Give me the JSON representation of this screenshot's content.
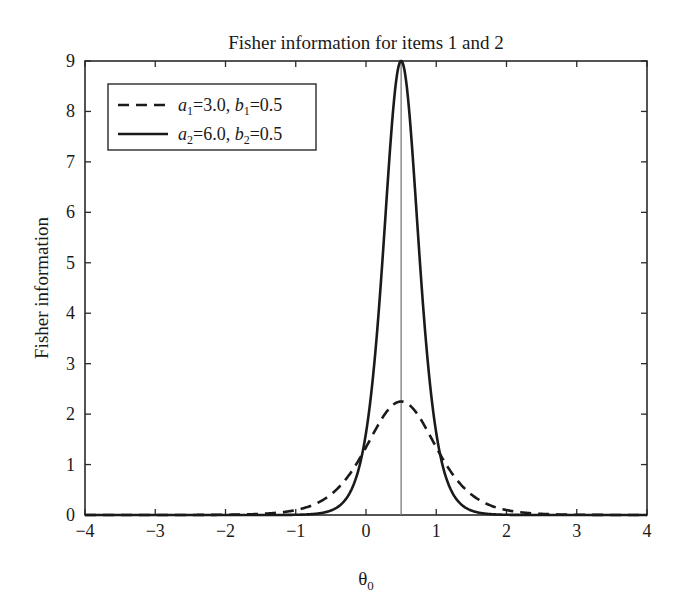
{
  "chart_data": {
    "type": "line",
    "title": "Fisher information for items 1 and 2",
    "xlabel": "θ",
    "xlabel_subscript": "0",
    "ylabel": "Fisher information",
    "xlim": [
      -4,
      4
    ],
    "ylim": [
      0,
      9
    ],
    "xticks": [
      -4,
      -3,
      -2,
      -1,
      0,
      1,
      2,
      3,
      4
    ],
    "xtick_labels": [
      "−4",
      "−3",
      "−2",
      "−1",
      "0",
      "1",
      "2",
      "3",
      "4"
    ],
    "yticks": [
      0,
      1,
      2,
      3,
      4,
      5,
      6,
      7,
      8,
      9
    ],
    "ytick_labels": [
      "0",
      "1",
      "2",
      "3",
      "4",
      "5",
      "6",
      "7",
      "8",
      "9"
    ],
    "grid": false,
    "tick_direction": "in",
    "legend_position": "upper left",
    "vertical_reference_line": {
      "x": 0.5,
      "color": "#7a7a7a"
    },
    "series": [
      {
        "name": "a1=3.0, b1=0.5",
        "legend": {
          "a_sym": "a",
          "a_sub": "1",
          "a_val": "=3.0, ",
          "b_sym": "b",
          "b_sub": "1",
          "b_val": "=0.5"
        },
        "style": "dashed",
        "a": 3.0,
        "b": 0.5,
        "x": [
          -4,
          -3,
          -2,
          -1.5,
          -1,
          -0.5,
          0,
          0.25,
          0.5,
          0.75,
          1,
          1.5,
          2,
          2.5,
          3,
          4
        ],
        "values": [
          0.0,
          0.0,
          0.0,
          0.02,
          0.1,
          0.4,
          1.22,
          1.84,
          2.25,
          1.84,
          1.22,
          0.4,
          0.1,
          0.02,
          0.0,
          0.0
        ]
      },
      {
        "name": "a2=6.0, b2=0.5",
        "legend": {
          "a_sym": "a",
          "a_sub": "2",
          "a_val": "=6.0, ",
          "b_sym": "b",
          "b_sub": "2",
          "b_val": "=0.5"
        },
        "style": "solid",
        "a": 6.0,
        "b": 0.5,
        "x": [
          -4,
          -2,
          -1,
          -0.5,
          -0.25,
          0,
          0.25,
          0.5,
          0.75,
          1,
          1.25,
          1.5,
          2,
          3,
          4
        ],
        "values": [
          0.0,
          0.0,
          0.0,
          0.09,
          0.39,
          1.62,
          5.27,
          9.0,
          5.27,
          1.62,
          0.39,
          0.09,
          0.0,
          0.0,
          0.0
        ]
      }
    ]
  },
  "colors": {
    "axis": "#2a2a2a",
    "curve": "#1a1a1a",
    "reference_line": "#7a7a7a",
    "background": "#ffffff"
  }
}
